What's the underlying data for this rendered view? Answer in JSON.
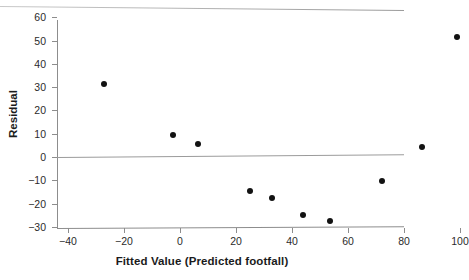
{
  "chart_data": {
    "type": "scatter",
    "title": "",
    "xlabel": "Fitted Value (Predicted footfall)",
    "ylabel": "Residual",
    "xlim": [
      -45,
      108
    ],
    "ylim": [
      -32,
      62
    ],
    "xticks": [
      -40,
      -20,
      0,
      20,
      40,
      60,
      80,
      100
    ],
    "xtick_labels": [
      "−40",
      "−20",
      "0",
      "20",
      "40",
      "60",
      "80",
      "100"
    ],
    "yticks": [
      -30,
      -20,
      -10,
      0,
      10,
      20,
      30,
      40,
      50,
      60
    ],
    "ytick_labels": [
      "−30",
      "−20",
      "−10",
      "0",
      "10",
      "20",
      "30",
      "40",
      "50",
      "60"
    ],
    "grid": false,
    "legend": "none",
    "reference_line": {
      "y": 0,
      "color": "#9b9b9b"
    },
    "marker": {
      "shape": "circle",
      "color": "#121212",
      "size": 6
    },
    "x": [
      -27,
      -2.5,
      6.5,
      25,
      33,
      44,
      53.5,
      72,
      86.5,
      99
    ],
    "y": [
      31.5,
      9.5,
      5.5,
      -14.5,
      -17.5,
      -25,
      -27.5,
      -10.5,
      4.5,
      51.5
    ],
    "points": [
      {
        "x": -27,
        "y": 31.5
      },
      {
        "x": -2.5,
        "y": 9.5
      },
      {
        "x": 6.5,
        "y": 5.5
      },
      {
        "x": 25,
        "y": -14.5
      },
      {
        "x": 33,
        "y": -17.5
      },
      {
        "x": 44,
        "y": -25
      },
      {
        "x": 53.5,
        "y": -27.5
      },
      {
        "x": 72,
        "y": -10.5
      },
      {
        "x": 86.5,
        "y": 4.5
      },
      {
        "x": 99,
        "y": 51.5
      }
    ]
  }
}
